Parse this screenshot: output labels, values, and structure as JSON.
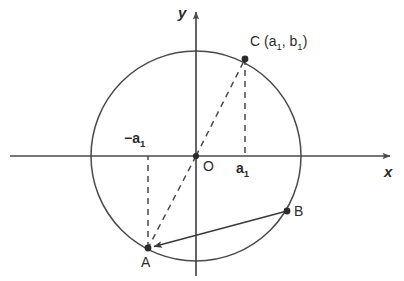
{
  "figure": {
    "background_color": "#ffffff",
    "stroke_color": "#4a4a4a",
    "text_color": "#2b2b2b",
    "width": 404,
    "height": 281
  },
  "axes": {
    "x_label": "x",
    "y_label": "y",
    "origin_label": "O",
    "origin": {
      "x": 196,
      "y": 156
    },
    "x_axis": {
      "x1": 10,
      "y1": 156,
      "x2": 394,
      "y2": 156,
      "arrow": "right"
    },
    "y_axis": {
      "x1": 196,
      "y1": 275,
      "x2": 196,
      "y2": 8,
      "arrow": "up"
    }
  },
  "circle": {
    "center_x": 196,
    "center_y": 156,
    "radius": 105,
    "stroke": "#4a4a4a"
  },
  "points": [
    {
      "name": "A",
      "label": "A",
      "x": 148,
      "y": 248,
      "label_x": 141,
      "label_y": 255
    },
    {
      "name": "B",
      "label": "B",
      "x": 287,
      "y": 211,
      "label_x": 294,
      "label_y": 205
    },
    {
      "name": "C",
      "label": "C",
      "x": 245,
      "y": 59,
      "label_x": 251,
      "label_y": 41
    }
  ],
  "tick_labels": [
    {
      "text": "a",
      "subscript": "1",
      "x": 236,
      "y": 160,
      "name": "a1-positive"
    },
    {
      "text": "−a",
      "subscript": "1",
      "x": 128,
      "y": 131,
      "name": "a1-negative"
    }
  ],
  "coordinate_label": {
    "point": "C",
    "open_paren": "(",
    "first": "a",
    "first_sub": "1",
    "comma": ", ",
    "second": "b",
    "second_sub": "1",
    "close_paren": ")",
    "full_text": "C (a1, b1)"
  },
  "dashed_segments": [
    {
      "name": "c-to-xaxis",
      "x1": 245,
      "y1": 59,
      "x2": 245,
      "y2": 156
    },
    {
      "name": "o-to-c",
      "x1": 196,
      "y1": 156,
      "x2": 245,
      "y2": 59
    },
    {
      "name": "o-to-a",
      "x1": 196,
      "y1": 156,
      "x2": 148,
      "y2": 248
    },
    {
      "name": "a-to-xaxis",
      "x1": 148,
      "y1": 248,
      "x2": 148,
      "y2": 156
    }
  ],
  "solid_segments": [
    {
      "name": "b-to-a-vector",
      "x1": 287,
      "y1": 211,
      "x2": 148,
      "y2": 248,
      "arrow": "end"
    }
  ]
}
